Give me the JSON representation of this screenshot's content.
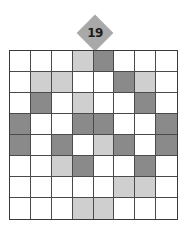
{
  "puzzle": {
    "number": "19",
    "rows": 8,
    "cols": 8,
    "colors": {
      "dark": "#8a8a8a",
      "light": "#cfcfcf",
      "white": "#ffffff",
      "badge": "#a9a9a9",
      "grid_line": "#4a4a4a"
    },
    "grid": [
      [
        "white",
        "white",
        "white",
        "light",
        "dark",
        "white",
        "white",
        "white"
      ],
      [
        "white",
        "light",
        "light",
        "white",
        "white",
        "dark",
        "light",
        "white"
      ],
      [
        "white",
        "dark",
        "white",
        "light",
        "white",
        "white",
        "dark",
        "white"
      ],
      [
        "dark",
        "white",
        "white",
        "dark",
        "dark",
        "white",
        "white",
        "dark"
      ],
      [
        "dark",
        "white",
        "dark",
        "white",
        "light",
        "dark",
        "white",
        "dark"
      ],
      [
        "white",
        "white",
        "light",
        "dark",
        "white",
        "white",
        "dark",
        "white"
      ],
      [
        "white",
        "white",
        "white",
        "white",
        "white",
        "light",
        "light",
        "white"
      ],
      [
        "white",
        "white",
        "white",
        "light",
        "light",
        "white",
        "white",
        "white"
      ]
    ]
  }
}
